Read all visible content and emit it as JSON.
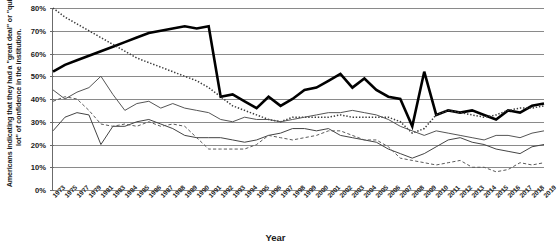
{
  "chart_data": {
    "type": "line",
    "title": "",
    "xlabel": "Year",
    "ylabel": "Americans indicating that they had a \"great deal\" or \"quite a lot\" of confidence in the institution.",
    "ylim": [
      0,
      80
    ],
    "ytick_labels": [
      "0%",
      "10%",
      "20%",
      "30%",
      "40%",
      "50%",
      "60%",
      "70%",
      "80%"
    ],
    "ytick_values": [
      0,
      10,
      20,
      30,
      40,
      50,
      60,
      70,
      80
    ],
    "grid": true,
    "legend_position": "none",
    "categories": [
      "1973",
      "1975",
      "1977",
      "1979",
      "1981",
      "1983",
      "1984",
      "1985",
      "1986",
      "1987",
      "1988",
      "1989",
      "1990",
      "1991",
      "1992",
      "1993",
      "1994",
      "1995",
      "1996",
      "1997",
      "1998",
      "1999",
      "2000",
      "2001",
      "2002",
      "2003",
      "2004",
      "2005",
      "2006",
      "2007",
      "2008",
      "2009",
      "2010",
      "2011",
      "2012",
      "2013",
      "2014",
      "2015",
      "2016",
      "2017",
      "2018",
      "2019"
    ],
    "series": [
      {
        "name": "Military",
        "style": "thick-solid",
        "color": "#000000",
        "values": [
          52,
          55,
          57,
          59,
          61,
          63,
          65,
          67,
          69,
          70,
          71,
          72,
          71,
          72,
          41,
          42,
          39,
          36,
          41,
          37,
          40,
          44,
          45,
          48,
          51,
          45,
          49,
          44,
          41,
          40,
          28,
          52,
          33,
          35,
          34,
          35,
          33,
          31,
          35,
          34,
          37,
          38
        ]
      },
      {
        "name": "Church or organized religion",
        "style": "dotted",
        "color": "#3a3a3a",
        "values": [
          80,
          76,
          73,
          70,
          67,
          64,
          61,
          58,
          56,
          54,
          52,
          50,
          48,
          45,
          41,
          37,
          35,
          33,
          31,
          30,
          32,
          32,
          32,
          32,
          33,
          32,
          32,
          32,
          32,
          30,
          25,
          27,
          33,
          35,
          34,
          33,
          32,
          33,
          35,
          36,
          36,
          37
        ]
      },
      {
        "name": "Supreme Court",
        "style": "thin-solid",
        "color": "#555555",
        "values": [
          44,
          40,
          43,
          45,
          50,
          42,
          35,
          38,
          39,
          36,
          38,
          36,
          35,
          34,
          31,
          30,
          32,
          31,
          31,
          30,
          31,
          32,
          33,
          34,
          34,
          35,
          34,
          33,
          31,
          28,
          26,
          24,
          26,
          25,
          24,
          23,
          22,
          24,
          24,
          23,
          25,
          26
        ]
      },
      {
        "name": "Public schools",
        "style": "thin-solid-2",
        "color": "#444444",
        "values": [
          26,
          32,
          34,
          33,
          20,
          28,
          28,
          30,
          31,
          29,
          27,
          24,
          23,
          23,
          23,
          22,
          21,
          22,
          24,
          25,
          27,
          27,
          26,
          27,
          24,
          23,
          22,
          21,
          18,
          16,
          14,
          16,
          19,
          22,
          23,
          21,
          20,
          18,
          17,
          16,
          19,
          20
        ]
      },
      {
        "name": "Newspapers / Congress",
        "style": "dashed",
        "color": "#5a5a5a",
        "values": [
          39,
          41,
          40,
          35,
          29,
          28,
          29,
          28,
          30,
          28,
          29,
          28,
          23,
          18,
          18,
          18,
          18,
          20,
          24,
          23,
          22,
          23,
          24,
          26,
          26,
          24,
          22,
          22,
          19,
          14,
          13,
          12,
          11,
          12,
          13,
          10,
          10,
          8,
          9,
          12,
          11,
          12
        ]
      }
    ]
  },
  "axis": {
    "y_title": "Americans indicating that they had a \"great deal\" or \"quite a lot\" of confidence in the institution.",
    "x_title": "Year"
  }
}
